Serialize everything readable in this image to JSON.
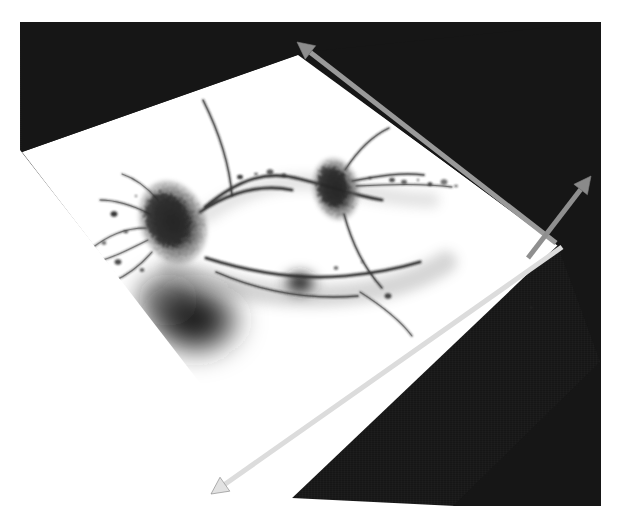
{
  "figure": {
    "modality": "confocal microscopy maximum-intensity projection",
    "background_color": "#161616",
    "slice_plane_color": "#ffffff",
    "page_margin_color": "#ffffff",
    "canvas_width": 619,
    "canvas_height": 530
  },
  "viewport": {
    "name": "render-viewport",
    "x": 20,
    "y": 22,
    "width": 581,
    "height": 484
  },
  "slice_plane": {
    "label": "image-slice-plane",
    "fill": "#ffffff",
    "corners": [
      [
        22,
        152
      ],
      [
        298,
        55
      ],
      [
        558,
        245
      ],
      [
        290,
        500
      ]
    ]
  },
  "dark_regions": [
    {
      "label": "upper-left-dark-wedge",
      "fill": "#161616",
      "corners": [
        [
          20,
          22
        ],
        [
          601,
          22
        ],
        [
          601,
          60
        ],
        [
          300,
          54
        ],
        [
          22,
          152
        ]
      ]
    },
    {
      "label": "lower-right-dark-wedge",
      "fill": "#161616",
      "corners": [
        [
          601,
          360
        ],
        [
          601,
          506
        ],
        [
          455,
          506
        ]
      ]
    }
  ],
  "axes": {
    "label": "3d-orientation-axes",
    "arrows": [
      {
        "name": "axis-arrow-up-left",
        "direction": "up-left",
        "color": "#9a9a9a",
        "head_color": "#8d8d8d",
        "tail": [
          556,
          243
        ],
        "tip": [
          297,
          42
        ],
        "width": 5
      },
      {
        "name": "axis-arrow-up-right",
        "direction": "up-right",
        "color": "#8f8f8f",
        "head_color": "#8a8a8a",
        "tail": [
          528,
          258
        ],
        "tip": [
          591,
          176
        ],
        "width": 5
      },
      {
        "name": "axis-arrow-down-left",
        "direction": "down-left",
        "color": "#dcdcdc",
        "head_color": "#e2e2e2",
        "tail": [
          562,
          247
        ],
        "tip": [
          211,
          494
        ],
        "width": 5
      }
    ]
  },
  "specimen": {
    "label": "neuron-specimen",
    "description": "two labelled neuronal somata connected by a dendritic process, with fine branching neurites and an out-of-focus dark halo",
    "ink_color": "#1b1b1b",
    "somata": [
      {
        "name": "soma-left",
        "cx": 173,
        "cy": 222,
        "rx": 29,
        "ry": 38,
        "rotation": -22,
        "intensity": "dark"
      },
      {
        "name": "soma-right",
        "cx": 336,
        "cy": 189,
        "rx": 20,
        "ry": 28,
        "rotation": -12,
        "intensity": "dark"
      }
    ],
    "dense_blobs": [
      {
        "name": "out-of-focus-halo-main",
        "cx": 196,
        "cy": 320,
        "rx": 52,
        "ry": 41,
        "blur": 13
      },
      {
        "name": "out-of-focus-halo-secondary",
        "cx": 300,
        "cy": 283,
        "rx": 19,
        "ry": 14,
        "blur": 5
      }
    ],
    "processes": [
      {
        "name": "apical-dendrite-ascending",
        "path": "M200,212 C230,192 262,184 292,190"
      },
      {
        "name": "primary-dendrite-arc",
        "path": "M205,207 C240,178 268,170 300,179 C330,186 352,195 382,200"
      },
      {
        "name": "ascending-neurite-top-left",
        "path": "M232,196 C230,170 222,138 203,100"
      },
      {
        "name": "neurite-upper-right",
        "path": "M345,170 C358,150 372,136 389,128"
      },
      {
        "name": "neurite-right-branch",
        "path": "M352,181 C378,176 402,172 424,175"
      },
      {
        "name": "neurite-far-right",
        "path": "M356,186 C392,184 424,183 452,187"
      },
      {
        "name": "descending-neurite-right",
        "path": "M344,214 C352,244 364,268 382,288"
      },
      {
        "name": "basal-dendrite-long",
        "path": "M206,258 C250,272 300,280 345,276 C378,273 400,268 420,262"
      },
      {
        "name": "basal-dendrite-lower",
        "path": "M216,272 C262,292 310,300 358,296"
      },
      {
        "name": "neurite-lower-right-tail",
        "path": "M360,292 C382,306 400,320 412,336"
      },
      {
        "name": "neurite-left-spray-1",
        "path": "M150,214 C132,205 116,200 100,200"
      },
      {
        "name": "neurite-left-spray-2",
        "path": "M146,228 C124,228 108,236 92,248"
      },
      {
        "name": "neurite-left-spray-3",
        "path": "M148,240 C128,250 112,258 96,262"
      },
      {
        "name": "neurite-left-spray-4",
        "path": "M152,252 C140,266 126,276 112,282"
      },
      {
        "name": "neurite-left-spray-5",
        "path": "M158,200 C146,186 134,178 122,174"
      }
    ],
    "puncta": [
      [
        90,
        252
      ],
      [
        104,
        243
      ],
      [
        118,
        262
      ],
      [
        126,
        232
      ],
      [
        100,
        276
      ],
      [
        136,
        196
      ],
      [
        142,
        270
      ],
      [
        114,
        214
      ],
      [
        96,
        290
      ],
      [
        404,
        182
      ],
      [
        418,
        180
      ],
      [
        430,
        184
      ],
      [
        444,
        182
      ],
      [
        456,
        186
      ],
      [
        392,
        180
      ],
      [
        370,
        178
      ],
      [
        284,
        175
      ],
      [
        270,
        172
      ],
      [
        256,
        174
      ],
      [
        240,
        177
      ],
      [
        362,
        262
      ],
      [
        336,
        268
      ],
      [
        388,
        296
      ]
    ]
  },
  "seams": [
    {
      "name": "scan-seam-left",
      "x": 348,
      "top": 22,
      "height": 40,
      "opacity": 0.18
    },
    {
      "name": "scan-seam-right",
      "x": 358,
      "top": 22,
      "height": 58,
      "opacity": 0.14
    }
  ]
}
